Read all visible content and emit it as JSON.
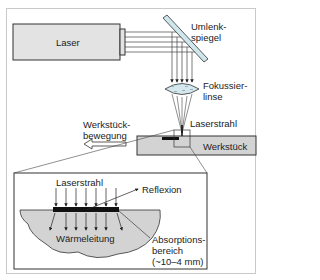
{
  "diagram": {
    "title": "",
    "components": {
      "laser": "Laser",
      "mirror": "Umlenk-\nspiegel",
      "lens": "Fokussier-\nlinse",
      "beam_top": "Laserstrahl",
      "workpiece_motion": "Werkstück-\nbewegung",
      "workpiece": "Werkstück"
    },
    "detail": {
      "beam": "Laserstrahl",
      "reflection": "Reflexion",
      "heat_conduction": "Wärmeleitung",
      "absorption": "Absorptions-\nbereich\n(~10–4 mm)"
    },
    "colors": {
      "laser_fill": "#e3e3e3",
      "mirror_fill": "#cfe6ec",
      "lens_fill": "#d6e8ee",
      "workpiece_fill": "#d3d3d3",
      "absorption_fill": "#111111",
      "stroke": "#333333"
    }
  }
}
